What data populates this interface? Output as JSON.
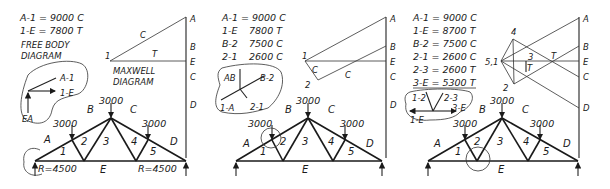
{
  "panels": [
    {
      "id": "panel-1",
      "results": [
        "A-1 = 9000 C",
        "1-E = 7800 T"
      ],
      "caption_1": "FREE BODY",
      "caption_2": "DIAGRAM",
      "maxwell_1": "MAXWELL",
      "maxwell_2": "DIAGRAM",
      "fbd_labels": {
        "a1": "A-1",
        "ie": "1-E",
        "ea": "EA"
      },
      "maxwell_labels": {
        "A": "A",
        "B": "B",
        "E": "E",
        "C": "C",
        "D": "D",
        "p1": "1",
        "c": "C",
        "t": "T"
      },
      "truss": {
        "loads": [
          "3000",
          "3000",
          "3000"
        ],
        "regions": {
          "A": "A",
          "B": "B",
          "C": "C",
          "D": "D",
          "E": "E"
        },
        "panels": [
          "1",
          "2",
          "3",
          "4",
          "5"
        ],
        "reactions": [
          "R=4500",
          "R=4500"
        ]
      }
    },
    {
      "id": "panel-2",
      "results": [
        "A-1 = 9000 C",
        "1-E",
        "7800 T",
        "B-2",
        "7500 C",
        "2-1",
        "2600 C"
      ],
      "fbd_labels": {
        "ab": "AB",
        "b2": "B-2",
        "a1": "1-A",
        "r21": "2-1"
      },
      "maxwell_labels": {
        "A": "A",
        "B": "B",
        "E": "E",
        "C": "C",
        "D": "D",
        "p1": "1",
        "p2": "2",
        "c1": "C",
        "c2": "C"
      },
      "truss": {
        "loads": [
          "3000",
          "3000",
          "3000"
        ],
        "regions": {
          "A": "A",
          "B": "B",
          "C": "C",
          "D": "D",
          "E": "E"
        },
        "panels": [
          "1",
          "2",
          "3",
          "4",
          "5"
        ]
      }
    },
    {
      "id": "panel-3",
      "results": [
        "A-1 = 9000 C",
        "1-E = 8700 T",
        "B-2 = 7500 C",
        "2-1 = 2600 C",
        "2-3 = 2600 T",
        "3-E = 5300 T"
      ],
      "fbd_labels": {
        "l12": "1-2",
        "l23": "2-3",
        "l3e": "3-E",
        "l1e": "1-E"
      },
      "maxwell_labels": {
        "A": "A",
        "B": "B",
        "E": "E",
        "C": "C",
        "D": "D",
        "p4": "4",
        "p3": "3",
        "p51": "5,1",
        "p2": "2",
        "t1": "T",
        "t2": "T"
      },
      "truss": {
        "loads": [
          "3000",
          "3000",
          "3000"
        ],
        "regions": {
          "A": "A",
          "B": "B",
          "C": "C",
          "D": "D",
          "E": "E"
        },
        "panels": [
          "1",
          "2",
          "3",
          "4",
          "5"
        ]
      }
    }
  ]
}
